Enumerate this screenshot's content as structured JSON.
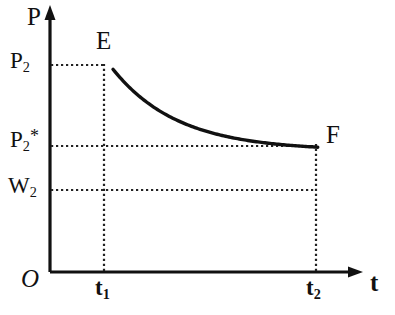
{
  "chart_data": {
    "type": "line",
    "title": "",
    "xlabel": "t",
    "ylabel": "P",
    "origin_label": "O",
    "grid": "dotted-guides",
    "legend": "none",
    "xlim": [
      0,
      1
    ],
    "ylim": [
      0,
      1
    ],
    "axes": {
      "x_axis_name": "t",
      "y_axis_name": "P",
      "x_arrow": true,
      "y_arrow": true
    },
    "x_ticks": [
      {
        "label": "t",
        "sub": "1",
        "value": 0.2
      },
      {
        "label": "t",
        "sub": "2",
        "value": 0.85
      }
    ],
    "y_ticks": [
      {
        "label": "P",
        "sub": "2",
        "sup": "",
        "value": 0.78
      },
      {
        "label": "P",
        "sub": "2",
        "sup": "*",
        "value": 0.48
      },
      {
        "label": "W",
        "sub": "2",
        "sup": "",
        "value": 0.31
      }
    ],
    "series": [
      {
        "name": "pressure-decay",
        "description": "Exponential decay of pressure P from E at t1 to F at t2",
        "style": "solid",
        "points": [
          {
            "x": 0.2,
            "y": 0.78
          },
          {
            "x": 0.232,
            "y": 0.735
          },
          {
            "x": 0.265,
            "y": 0.696
          },
          {
            "x": 0.297,
            "y": 0.662
          },
          {
            "x": 0.33,
            "y": 0.632
          },
          {
            "x": 0.362,
            "y": 0.605
          },
          {
            "x": 0.395,
            "y": 0.581
          },
          {
            "x": 0.427,
            "y": 0.6
          },
          {
            "x": 0.46,
            "y": 0.578
          },
          {
            "x": 0.492,
            "y": 0.559
          },
          {
            "x": 0.525,
            "y": 0.558
          },
          {
            "x": 0.557,
            "y": 0.542
          },
          {
            "x": 0.59,
            "y": 0.528
          },
          {
            "x": 0.622,
            "y": 0.522
          },
          {
            "x": 0.655,
            "y": 0.51
          },
          {
            "x": 0.687,
            "y": 0.5
          },
          {
            "x": 0.72,
            "y": 0.492
          },
          {
            "x": 0.752,
            "y": 0.485
          },
          {
            "x": 0.785,
            "y": 0.48
          },
          {
            "x": 0.817,
            "y": 0.482
          },
          {
            "x": 0.85,
            "y": 0.48
          }
        ]
      }
    ],
    "annotations": [
      {
        "name": "E",
        "label": "E",
        "x": 0.2,
        "y": 0.78,
        "note": "curve start, pressure P2 at time t1"
      },
      {
        "name": "F",
        "label": "F",
        "x": 0.85,
        "y": 0.48,
        "note": "curve end, pressure P2* at time t2"
      }
    ],
    "guide_lines": [
      {
        "name": "p2-horizontal",
        "orientation": "horizontal",
        "from_axis": true,
        "y": 0.78,
        "x_end": 0.2,
        "style": "dotted"
      },
      {
        "name": "p2star-horizontal",
        "orientation": "horizontal",
        "from_axis": true,
        "y": 0.48,
        "x_end": 0.85,
        "style": "dotted"
      },
      {
        "name": "w2-horizontal",
        "orientation": "horizontal",
        "from_axis": true,
        "y": 0.31,
        "x_end": 0.85,
        "style": "dotted"
      },
      {
        "name": "t1-vertical",
        "orientation": "vertical",
        "x": 0.2,
        "y_from": 0.0,
        "y_to": 0.78,
        "style": "dotted"
      },
      {
        "name": "t2-vertical",
        "orientation": "vertical",
        "x": 0.85,
        "y_from": 0.0,
        "y_to": 0.48,
        "style": "dotted"
      }
    ],
    "colors": {
      "background": "#ffffff",
      "axis": "#111111",
      "curve": "#111111",
      "guides": "#333333",
      "text": "#111111"
    }
  }
}
